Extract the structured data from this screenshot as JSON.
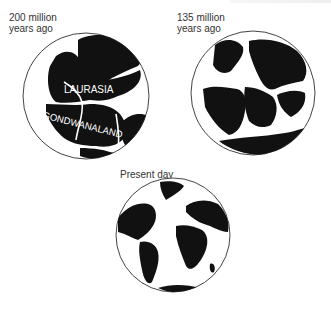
{
  "figure": {
    "panels": [
      {
        "id": "200mya",
        "caption": "200 million\nyears ago",
        "labels": [
          "LAURASIA",
          "GONDWANALAND"
        ]
      },
      {
        "id": "135mya",
        "caption": "135 million\nyears ago",
        "labels": []
      },
      {
        "id": "present",
        "caption": "Present day",
        "labels": []
      }
    ],
    "colors": {
      "land": "#111111",
      "ocean": "#ffffff",
      "outline": "#444444",
      "text": "#333333"
    }
  }
}
